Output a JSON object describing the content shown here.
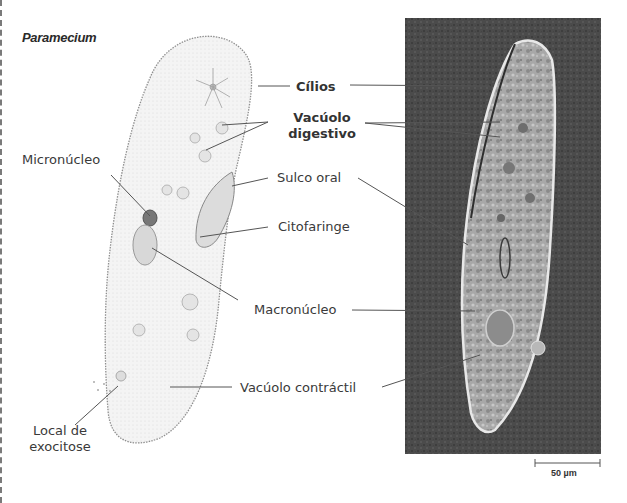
{
  "figure": {
    "title": "Paramecium",
    "labels": {
      "cilia": "Cílios",
      "digestive_vacuole_line1": "Vacúolo",
      "digestive_vacuole_line2": "digestivo",
      "micronucleus": "Micronúcleo",
      "oral_groove": "Sulco oral",
      "cytopharynx": "Citofaringe",
      "macronucleus": "Macronúcleo",
      "contractile_vacuole": "Vacúolo contráctil",
      "exocytosis_line1": "Local de",
      "exocytosis_line2": "exocitose"
    },
    "scale_bar": {
      "label": "50 µm"
    },
    "panels": {
      "left": "drawing",
      "right": "micrograph"
    },
    "colors": {
      "background": "#ffffff",
      "text": "#3a3a3a",
      "leader_line": "#555555",
      "micrograph_bg": "#4a4a4a",
      "cell_fill": "#f2f2f2",
      "cell_outline": "#9a9a9a"
    }
  }
}
